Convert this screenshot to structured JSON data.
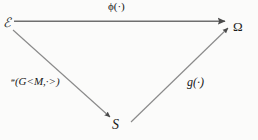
{
  "figure": {
    "type": "commutative-triangle-diagram",
    "background_color": "#fbfbfa",
    "stroke_color": "#6b6b6b",
    "text_color": "#1b1b1b",
    "width": 258,
    "height": 140
  },
  "nodes": [
    {
      "id": "epsilon",
      "label": "ℰ",
      "position": "top-left",
      "x": 7,
      "y": 24
    },
    {
      "id": "omega",
      "label": "Ω",
      "position": "top-right",
      "x": 240,
      "y": 28
    },
    {
      "id": "s",
      "label": "S",
      "position": "bottom-center",
      "x": 117,
      "y": 127
    }
  ],
  "edges": [
    {
      "id": "phi",
      "from": "epsilon",
      "to": "omega",
      "label": "ϕ(·)",
      "label_x": 120,
      "label_y": 8,
      "arrowhead": "solid-triangle"
    },
    {
      "id": "n",
      "from": "epsilon",
      "to": "s",
      "label_prefix": "ᵊ",
      "label_rest": "(G<M,·>)",
      "label": "ᵊ(G<M,·>)",
      "label_x": 43,
      "label_y": 84,
      "arrowhead": "solid-triangle"
    },
    {
      "id": "g",
      "from": "s",
      "to": "omega",
      "label": "g(·)",
      "label_x": 200,
      "label_y": 84,
      "arrowhead": "solid-triangle"
    }
  ]
}
